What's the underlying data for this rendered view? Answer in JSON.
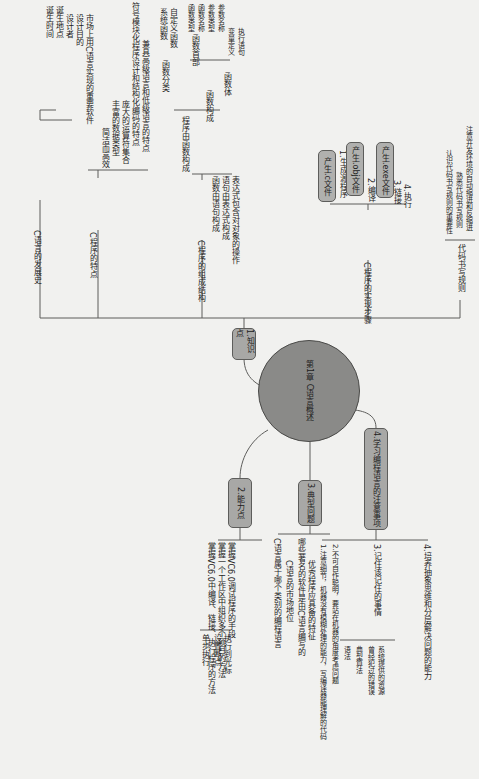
{
  "center": {
    "label": "第1章 C语言概述"
  },
  "branches": {
    "knowledge": {
      "label": "1.知识点",
      "history": {
        "label": "C语言的发展史",
        "items": [
          "诞生时间",
          "诞生地点",
          "设计者",
          "设计目的",
          "市场上用C语言实现的重要软件"
        ]
      },
      "features": {
        "label": "C程序的特点",
        "items": [
          "简洁而高效",
          "丰富的数据类型",
          "庞大的运算符集合",
          "符号模块化程序设计和结构化编码的特点",
          "兼具高级语言和低级语言的特点"
        ]
      },
      "structure": {
        "label": "C程序的组成结构",
        "functions": {
          "label": "程序由函数构成",
          "classification": {
            "label": "函数分类",
            "items": [
              "系统函数",
              "自定义函数"
            ]
          },
          "composition": {
            "label": "函数构成",
            "header": {
              "label": "函数首部",
              "items": [
                "函数类型",
                "函数名称",
                "参数类型",
                "参数名称"
              ]
            },
            "body": {
              "label": "函数体",
              "items": [
                "变量定义",
                "执行语句"
              ]
            }
          }
        },
        "items": [
          "函数由语句构成",
          "语句由表达式构成",
          "表达式包含对对象的操作"
        ]
      },
      "steps": {
        "label": "C程序的实现步骤",
        "items": [
          "1.生成源程序",
          "2.编译",
          "3.链接",
          "4.执行"
        ],
        "callouts": [
          "产生.c文件",
          "产生.obj文件",
          "产生.exe文件"
        ]
      },
      "rules": {
        "label": "代码书写规则",
        "items": [
          "认识代码书写规则的重要性",
          "熟悉代码书写规则",
          "注意开发环境的自动缩进和反缩进"
        ]
      }
    },
    "ability": {
      "label": "2.能力点",
      "items": [
        "掌握VC6.0中编译、链接、执行程序的方法",
        "掌握一个工作区中组织多个项目的方法"
      ],
      "debug": {
        "label": "掌握VC6.0调试程序的手段",
        "items": [
          "单步执行",
          "设置断点",
          "执行到光标"
        ]
      }
    },
    "problems": {
      "label": "3.典型问题",
      "items": [
        "C语言属于哪个类别的编程语言",
        "C语言的市场地位",
        "哪些著名的软件是由C语言编写的",
        "优秀程序应具备的特征"
      ]
    },
    "notes": {
      "label": "4.学习编程语言的注意事项",
      "items": [
        "1.注意细节，机器没有模糊处理的能力，写编译器能理解的代码",
        "2.不可自作聪明，要站在机器的角度考虑问题",
        "4.培养抽象思维和分层解决问题的能力"
      ],
      "remember": {
        "label": "3.记住该记住的事情",
        "items": [
          "语法",
          "典型算法",
          "曾经犯过的错误",
          "系统提供的资源"
        ]
      }
    }
  },
  "colors": {
    "node": "#a8a8a6",
    "center": "#8a8a88",
    "line": "#5d5d5b",
    "background": "#f1f1ef"
  }
}
